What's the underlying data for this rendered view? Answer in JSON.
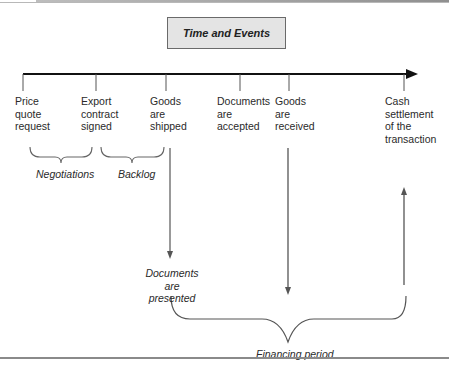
{
  "diagram": {
    "title": "Time and Events",
    "events": [
      {
        "id": "price-quote-request",
        "label": "Price\nquote\nrequest"
      },
      {
        "id": "export-contract-signed",
        "label": "Export\ncontract\nsigned"
      },
      {
        "id": "goods-shipped",
        "label": "Goods\nare\nshipped"
      },
      {
        "id": "documents-accepted",
        "label": "Documents\nare\naccepted"
      },
      {
        "id": "goods-received",
        "label": "Goods\nare\nreceived"
      },
      {
        "id": "cash-settlement",
        "label": "Cash\nsettlement\nof the\ntransaction"
      }
    ],
    "periods": [
      {
        "id": "negotiations",
        "label": "Negotiations"
      },
      {
        "id": "backlog",
        "label": "Backlog"
      },
      {
        "id": "financing",
        "label": "Financing period"
      }
    ],
    "intermediate_event": {
      "label": "Documents are\npresented"
    },
    "colors": {
      "box_fill": "#e4e4e4",
      "box_border": "#6a6a6a",
      "line": "#555555",
      "timeline": "#111111"
    }
  }
}
